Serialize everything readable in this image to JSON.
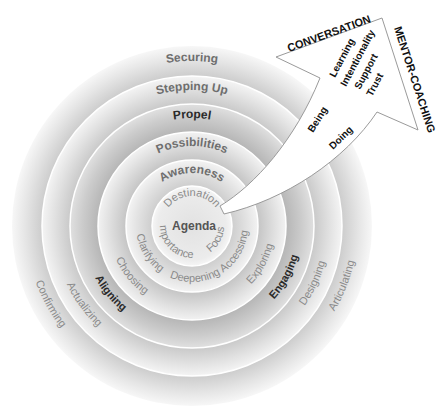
{
  "diagram": {
    "center": {
      "title": "Agenda",
      "ring_words": [
        "Destination",
        "Importance",
        "Focus"
      ]
    },
    "rings": [
      {
        "level": 1,
        "top": "Awareness",
        "words": [
          "Clarifying",
          "Deepening",
          "Accessing"
        ]
      },
      {
        "level": 2,
        "top": "Possibilities",
        "words": [
          "Choosing",
          "Exploring"
        ]
      },
      {
        "level": 3,
        "top": "Propel",
        "words": [
          "Aligning",
          "Engaging"
        ]
      },
      {
        "level": 4,
        "top": "Stepping Up",
        "words": [
          "Actualizing",
          "Designing"
        ]
      },
      {
        "level": 5,
        "top": "Securing",
        "words": [
          "Confirming",
          "Articulating"
        ]
      }
    ],
    "arrow": {
      "top_edge_label": "CONVERSATION",
      "right_edge_label": "MENTOR-COACHING",
      "head_words": [
        "Learning",
        "Intentionality",
        "Support",
        "Trust"
      ],
      "shaft_words": [
        "Being",
        "Doing"
      ]
    },
    "colors": {
      "ring_light": "#f2f2f2",
      "ring_mid": "#dcdcdc",
      "ring_dark": "#c4c4c4",
      "arrow_fill": "#ffffff",
      "arrow_stroke": "#9a9a9a"
    }
  }
}
